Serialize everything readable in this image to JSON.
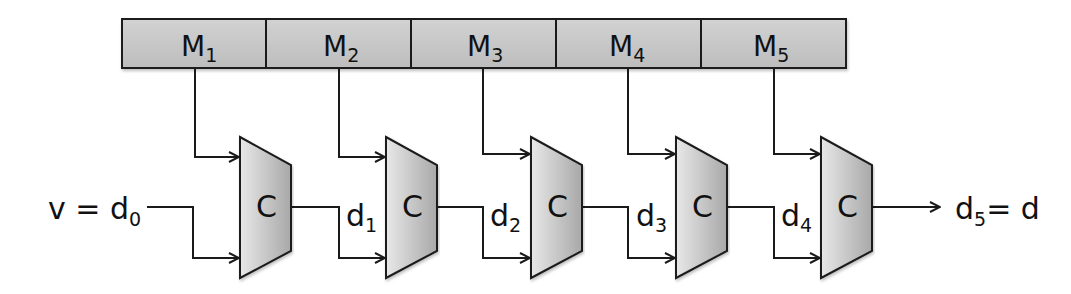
{
  "diagram": {
    "title": "",
    "memory_bar": {
      "cells": [
        {
          "label": "M",
          "sub": "1"
        },
        {
          "label": "M",
          "sub": "2"
        },
        {
          "label": "M",
          "sub": "3"
        },
        {
          "label": "M",
          "sub": "4"
        },
        {
          "label": "M",
          "sub": "5"
        }
      ],
      "fill_color": "#c8c8c8"
    },
    "blocks": [
      {
        "label": "C"
      },
      {
        "label": "C"
      },
      {
        "label": "C"
      },
      {
        "label": "C"
      },
      {
        "label": "C"
      }
    ],
    "input": {
      "lhs": "v = d",
      "sub": "0"
    },
    "intermediates": [
      {
        "label": "d",
        "sub": "1"
      },
      {
        "label": "d",
        "sub": "2"
      },
      {
        "label": "d",
        "sub": "3"
      },
      {
        "label": "d",
        "sub": "4"
      }
    ],
    "output": {
      "label": "d",
      "sub": "5",
      "rhs": "= d"
    },
    "colors": {
      "block_fill_light": "#e6e6e6",
      "block_fill_dark": "#a9a9a9",
      "stroke": "#1a1a1a"
    }
  }
}
